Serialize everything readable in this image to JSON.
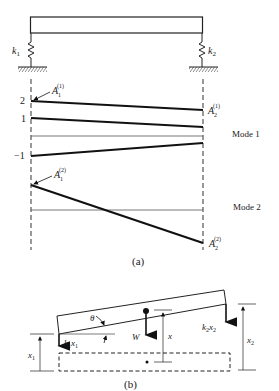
{
  "figure": {
    "part_a": {
      "caption": "(a)",
      "springs": [
        {
          "label": "k",
          "sub": "1"
        },
        {
          "label": "k",
          "sub": "2"
        }
      ],
      "ticks": {
        "two": "2",
        "one": "1",
        "minus_one": "−1"
      },
      "mode1": {
        "label": "Mode 1",
        "A1": {
          "base": "A",
          "sub": "1",
          "sup": "(1)"
        },
        "A2": {
          "base": "A",
          "sub": "2",
          "sup": "(1)"
        }
      },
      "mode2": {
        "label": "Mode 2",
        "A1": {
          "base": "A",
          "sub": "1",
          "sup": "(2)"
        },
        "A2": {
          "base": "A",
          "sub": "2",
          "sup": "(2)"
        }
      }
    },
    "part_b": {
      "caption": "(b)",
      "theta": "θ",
      "weight": "W",
      "x": "x",
      "x1": {
        "base": "x",
        "sub": "1"
      },
      "x2": {
        "base": "x",
        "sub": "2"
      },
      "force1": {
        "k": "k",
        "ksub": "1",
        "x": "x",
        "xsub": "1"
      },
      "force2": {
        "k": "k",
        "ksub": "2",
        "x": "x",
        "xsub": "2"
      }
    }
  }
}
